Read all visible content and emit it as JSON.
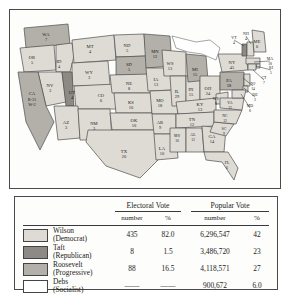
{
  "map": {
    "name": "united-states-electoral-map-1912",
    "states": [
      {
        "ab": "WA",
        "votes": "7",
        "party": "roosevelt",
        "x": 36,
        "y": 25
      },
      {
        "ab": "OR",
        "votes": "5",
        "party": "wilson",
        "x": 22,
        "y": 48
      },
      {
        "ab": "ID",
        "votes": "4",
        "party": "wilson",
        "x": 49,
        "y": 52
      },
      {
        "ab": "MT",
        "votes": "4",
        "party": "wilson",
        "x": 80,
        "y": 37
      },
      {
        "ab": "ND",
        "votes": "5",
        "party": "wilson",
        "x": 117,
        "y": 36
      },
      {
        "ab": "MN",
        "votes": "12",
        "party": "roosevelt",
        "x": 145,
        "y": 42
      },
      {
        "ab": "SD",
        "votes": "5",
        "party": "roosevelt",
        "x": 119,
        "y": 55
      },
      {
        "ab": "WY",
        "votes": "3",
        "party": "wilson",
        "x": 79,
        "y": 63
      },
      {
        "ab": "NE",
        "votes": "8",
        "party": "wilson",
        "x": 119,
        "y": 74
      },
      {
        "ab": "NV",
        "votes": "3",
        "party": "wilson",
        "x": 40,
        "y": 76
      },
      {
        "ab": "UT",
        "votes": "4",
        "party": "taft",
        "x": 62,
        "y": 83
      },
      {
        "ab": "CO",
        "votes": "6",
        "party": "wilson",
        "x": 91,
        "y": 86
      },
      {
        "ab": "KS",
        "votes": "10",
        "party": "wilson",
        "x": 121,
        "y": 93
      },
      {
        "ab": "AZ",
        "votes": "3",
        "party": "wilson",
        "x": 56,
        "y": 113
      },
      {
        "ab": "NM",
        "votes": "3",
        "party": "wilson",
        "x": 84,
        "y": 114
      },
      {
        "ab": "OK",
        "votes": "10",
        "party": "wilson",
        "x": 124,
        "y": 111
      },
      {
        "ab": "TX",
        "votes": "20",
        "party": "wilson",
        "x": 114,
        "y": 142
      },
      {
        "ab": "IA",
        "votes": "13",
        "party": "wilson",
        "x": 146,
        "y": 70
      },
      {
        "ab": "MO",
        "votes": "18",
        "party": "wilson",
        "x": 150,
        "y": 91
      },
      {
        "ab": "AR",
        "votes": "9",
        "party": "wilson",
        "x": 150,
        "y": 113
      },
      {
        "ab": "LA",
        "votes": "10",
        "party": "wilson",
        "x": 152,
        "y": 139
      },
      {
        "ab": "WS",
        "votes": "13",
        "party": "wilson",
        "x": 160,
        "y": 54
      },
      {
        "ab": "IL",
        "votes": "29",
        "party": "wilson",
        "x": 167,
        "y": 82
      },
      {
        "ab": "IN",
        "votes": "15",
        "party": "wilson",
        "x": 181,
        "y": 80
      },
      {
        "ab": "MI",
        "votes": "15",
        "party": "roosevelt",
        "x": 185,
        "y": 60
      },
      {
        "ab": "OH",
        "votes": "24",
        "party": "wilson",
        "x": 198,
        "y": 79
      },
      {
        "ab": "KY",
        "votes": "13",
        "party": "wilson",
        "x": 190,
        "y": 95
      },
      {
        "ab": "TN",
        "votes": "12",
        "party": "wilson",
        "x": 182,
        "y": 110
      },
      {
        "ab": "MS",
        "votes": "10",
        "party": "wilson",
        "x": 167,
        "y": 126
      },
      {
        "ab": "AL",
        "votes": "12",
        "party": "wilson",
        "x": 183,
        "y": 125
      },
      {
        "ab": "GA",
        "votes": "14",
        "party": "wilson",
        "x": 202,
        "y": 127
      },
      {
        "ab": "FL",
        "votes": "6",
        "party": "wilson",
        "x": 217,
        "y": 153
      },
      {
        "ab": "SC",
        "votes": "9",
        "party": "wilson",
        "x": 214,
        "y": 119
      },
      {
        "ab": "NC",
        "votes": "12",
        "party": "wilson",
        "x": 215,
        "y": 106
      },
      {
        "ab": "WV",
        "votes": "8",
        "party": "wilson",
        "x": 206,
        "y": 89
      },
      {
        "ab": "VA",
        "votes": "12",
        "party": "wilson",
        "x": 220,
        "y": 93
      },
      {
        "ab": "PA",
        "votes": "38",
        "party": "roosevelt",
        "x": 219,
        "y": 71
      },
      {
        "ab": "NY",
        "votes": "45",
        "party": "wilson",
        "x": 222,
        "y": 53
      },
      {
        "ab": "ME",
        "votes": "6",
        "party": "wilson",
        "x": 247,
        "y": 32
      }
    ],
    "callouts": [
      {
        "ab": "VT",
        "votes": "4",
        "x": 224,
        "y": 28,
        "tx": 234,
        "ty": 36
      },
      {
        "ab": "NH",
        "votes": "4",
        "x": 236,
        "y": 24,
        "tx": 241,
        "ty": 34
      },
      {
        "ab": "MA",
        "votes": "18",
        "x": 260,
        "y": 49,
        "tx": 244,
        "ty": 52
      },
      {
        "ab": "RI",
        "votes": "5",
        "x": 261,
        "y": 58,
        "tx": 246,
        "ty": 56
      },
      {
        "ab": "CT",
        "votes": "7",
        "x": 254,
        "y": 68,
        "tx": 243,
        "ty": 60
      },
      {
        "ab": "NJ",
        "votes": "14",
        "x": 243,
        "y": 74,
        "tx": 233,
        "ty": 68
      },
      {
        "ab": "DE",
        "votes": "3",
        "x": 245,
        "y": 85,
        "tx": 234,
        "ty": 78
      },
      {
        "ab": "MD",
        "votes": "8",
        "x": 240,
        "y": 96,
        "tx": 231,
        "ty": 84
      }
    ],
    "california": {
      "ab": "CA",
      "line1": "R-11",
      "line2": "W-2",
      "party": "roosevelt",
      "x": 22,
      "y": 88
    }
  },
  "legend": {
    "group_headers": {
      "electoral": "Electoral Vote",
      "popular": "Popular Vote"
    },
    "sub_headers": {
      "en": "number",
      "ep": "%",
      "pn": "number",
      "pp": "%"
    },
    "rows": [
      {
        "name": "Wilson",
        "party": "(Democrat)",
        "swatch": "wilson",
        "electoral_number": "435",
        "electoral_pct": "82.0",
        "popular_number": "6,296,547",
        "popular_pct": "42"
      },
      {
        "name": "Taft",
        "party": "(Republican)",
        "swatch": "taft",
        "electoral_number": "8",
        "electoral_pct": "1.5",
        "popular_number": "3,486,720",
        "popular_pct": "23"
      },
      {
        "name": "Roosevelt",
        "party": "(Progressive)",
        "swatch": "roosevelt",
        "electoral_number": "88",
        "electoral_pct": "16.5",
        "popular_number": "4,118,571",
        "popular_pct": "27"
      },
      {
        "name": "Debs",
        "party": "(Socialist)",
        "swatch": "debs",
        "electoral_number": "——",
        "electoral_pct": "——",
        "popular_number": "900,672",
        "popular_pct": "6.0"
      }
    ]
  },
  "colors": {
    "wilson": "#dedbd4",
    "taft": "#8d8a85",
    "roosevelt": "#b3b0aa",
    "debs": "#ffffff",
    "border": "#4a4a4a",
    "text": "#1a1a1a"
  }
}
